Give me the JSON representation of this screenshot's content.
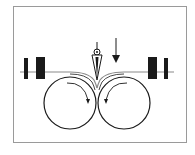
{
  "diagram": {
    "title": "Razor slitting between two rollers",
    "elements": {
      "frame": "border",
      "web": "material web passing over rollers",
      "left_roller": {
        "rotation": "clockwise"
      },
      "right_roller": {
        "rotation": "counter-clockwise"
      },
      "blade": "razor blade with pivot",
      "feed_arrow": "downward force arrow",
      "left_guides": 2,
      "right_guides": 2
    },
    "colors": {
      "stroke": "#1a1a1a",
      "frame": "#9a9a9a",
      "web": "#8a8a8a",
      "background": "#ffffff"
    }
  }
}
